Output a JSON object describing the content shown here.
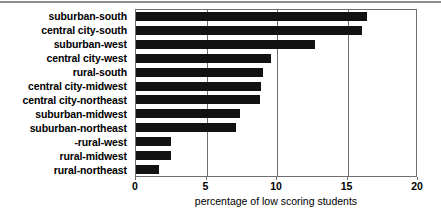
{
  "chart_data": {
    "type": "bar",
    "orientation": "horizontal",
    "title": "",
    "subtitle": "",
    "xlabel": "percentage of low scoring students",
    "ylabel": "",
    "xlim": [
      0,
      20
    ],
    "ylim": null,
    "grid": true,
    "grid_axis": "x",
    "legend": false,
    "legend_position": "none",
    "bar_color": "#121212",
    "axis_color": "#6f6f6f",
    "xticks": [
      0,
      5,
      10,
      15,
      20
    ],
    "xtick_labels": [
      "0",
      "5",
      "10",
      "15",
      "20"
    ],
    "categories": [
      "suburban-south",
      "central city-south",
      "suburban-west",
      "central city-west",
      "rural-south",
      "central city-midwest",
      "central city-northeast",
      "suburban-midwest",
      "suburban-northeast",
      "-rural-west",
      "rural-midwest",
      "rural-northeast"
    ],
    "values": [
      16.4,
      16.0,
      12.7,
      9.6,
      9.0,
      8.9,
      8.8,
      7.4,
      7.1,
      2.5,
      2.5,
      1.6
    ]
  }
}
